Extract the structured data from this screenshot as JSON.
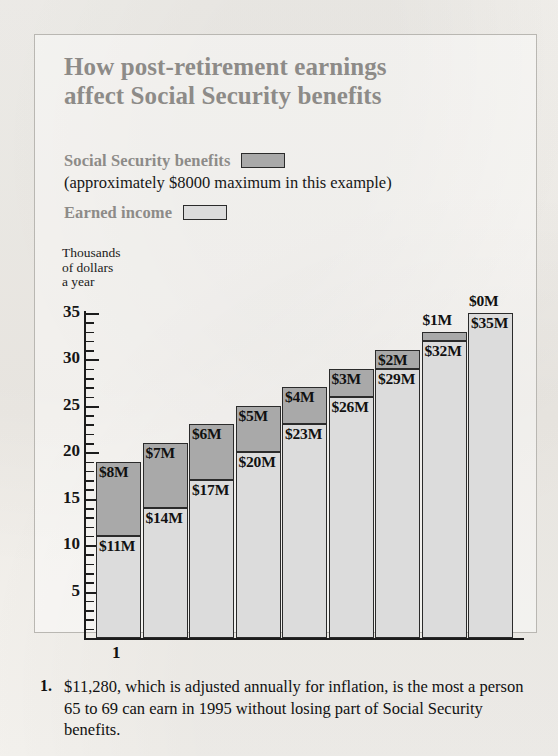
{
  "title": {
    "line1": "How post-retirement earnings",
    "line2": "affect Social Security benefits"
  },
  "legend": {
    "benefits_label": "Social Security benefits",
    "benefits_note": "(approximately $8000 maximum in this example)",
    "earned_label": "Earned income",
    "benefits_color": "#a9a9a9",
    "earned_color": "#dcdcdc"
  },
  "axis_caption": {
    "line1": "Thousands",
    "line2": "of dollars",
    "line3": "a year"
  },
  "footnote": {
    "number": "1.",
    "marker": "1",
    "text": "$11,280, which is adjusted annually for inflation, is the most a person 65 to 69 can earn in 1995 without losing part of Social Security benefits."
  },
  "chart_data": {
    "type": "bar",
    "subtype": "stacked-column",
    "title": "How post-retirement earnings affect Social Security benefits",
    "xlabel": "",
    "ylabel": "Thousands of dollars a year",
    "ylim": [
      0,
      35
    ],
    "yticks": [
      5,
      10,
      15,
      20,
      25,
      30,
      35
    ],
    "ytick_labels": [
      "5",
      "10",
      "15",
      "20",
      "25",
      "30",
      "35"
    ],
    "minor_tick_step": 1,
    "grid": false,
    "legend_position": "above-plot",
    "categories": [
      "1",
      "2",
      "3",
      "4",
      "5",
      "6",
      "7",
      "8",
      "9"
    ],
    "series": [
      {
        "name": "Earned income",
        "color": "#dcdcdc",
        "values": [
          11,
          14,
          17,
          20,
          23,
          26,
          29,
          32,
          35
        ],
        "labels": [
          "$11M",
          "$14M",
          "$17M",
          "$20M",
          "$23M",
          "$26M",
          "$29M",
          "$32M",
          "$35M"
        ],
        "label_placement": [
          "inside",
          "inside",
          "inside",
          "inside",
          "inside",
          "inside",
          "inside",
          "inside",
          "inside"
        ]
      },
      {
        "name": "Social Security benefits",
        "color": "#a9a9a9",
        "values": [
          8,
          7,
          6,
          5,
          4,
          3,
          2,
          1,
          0
        ],
        "labels": [
          "$8M",
          "$7M",
          "$6M",
          "$5M",
          "$4M",
          "$3M",
          "$2M",
          "$1M",
          "$0M"
        ],
        "label_placement": [
          "inside",
          "inside",
          "inside",
          "inside",
          "inside",
          "inside",
          "inside",
          "above",
          "above"
        ]
      }
    ],
    "totals": [
      19,
      21,
      23,
      25,
      27,
      29,
      31,
      33,
      35
    ],
    "annotations": [
      {
        "text": "1",
        "attached_to_category": "1",
        "position": "below-axis"
      }
    ]
  }
}
